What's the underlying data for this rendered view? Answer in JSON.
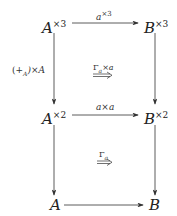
{
  "diagram": {
    "type": "commutative-diagram",
    "nodes": {
      "a3": {
        "base": "A",
        "sup": "×3"
      },
      "b3": {
        "base": "B",
        "sup": "×3"
      },
      "a2": {
        "base": "A",
        "sup": "×2"
      },
      "b2": {
        "base": "B",
        "sup": "×2"
      },
      "a1": {
        "base": "A"
      },
      "b1": {
        "base": "B"
      }
    },
    "arrows": {
      "top": {
        "base": "a",
        "sup": "×3"
      },
      "middle": {
        "text": "a×a"
      },
      "bottom": {
        "text": ""
      },
      "left_upper": {
        "text": "(+A)×A",
        "pre": "(+",
        "sub": "A",
        "post": ")×A"
      },
      "left_lower": {
        "text": ""
      },
      "right_upper": {
        "text": ""
      },
      "right_lower": {
        "text": ""
      }
    },
    "two_cells": {
      "upper": {
        "base": "Γ",
        "sub": "a",
        "post": "×a"
      },
      "lower": {
        "base": "Γ",
        "sub": "a",
        "post": ""
      }
    },
    "colors": {
      "stroke": "#333333",
      "text": "#222222"
    }
  }
}
